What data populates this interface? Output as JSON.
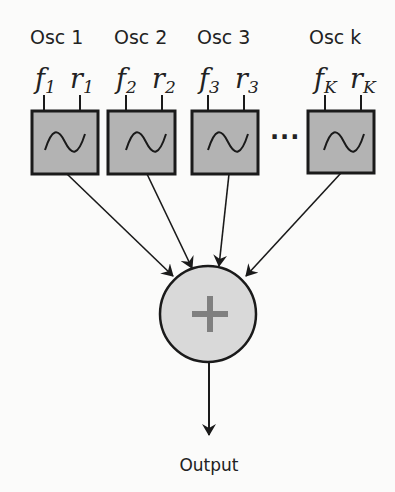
{
  "oscillators": [
    {
      "label": "Osc 1",
      "f": "f",
      "f_sub": "1",
      "r": "r",
      "r_sub": "1"
    },
    {
      "label": "Osc 2",
      "f": "f",
      "f_sub": "2",
      "r": "r",
      "r_sub": "2"
    },
    {
      "label": "Osc 3",
      "f": "f",
      "f_sub": "3",
      "r": "r",
      "r_sub": "3"
    },
    {
      "label": "Osc k",
      "f": "f",
      "f_sub": "K",
      "r": "r",
      "r_sub": "K"
    }
  ],
  "ellipsis": "···",
  "sum_node": {
    "symbol": "+"
  },
  "output_label": "Output",
  "colors": {
    "box_fill": "#b3b3b3",
    "circle_fill": "#d9d9d9",
    "plus": "#808080",
    "stroke": "#1a1a1a"
  }
}
